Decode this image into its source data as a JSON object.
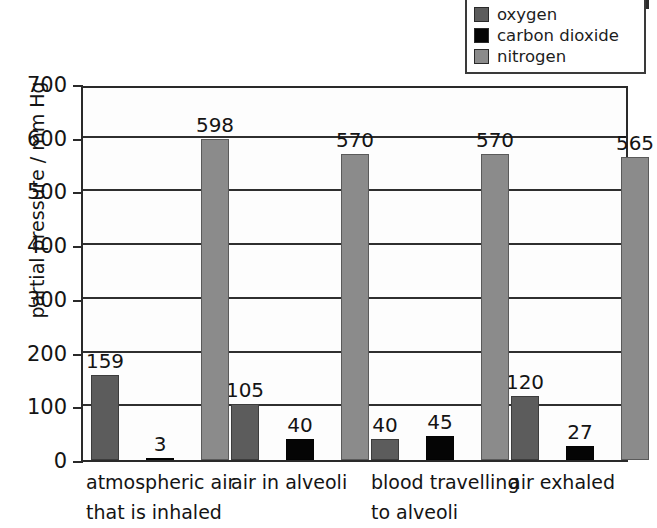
{
  "chart_data": {
    "type": "bar",
    "title": "",
    "subtitle": "",
    "xlabel": "",
    "ylabel": "partial pressure / mm Hg",
    "ylim": [
      0,
      700
    ],
    "ytick_step": 100,
    "yticks": [
      "0",
      "100",
      "200",
      "300",
      "400",
      "500",
      "600",
      "700"
    ],
    "grid": "horizontal",
    "legend_position": "top-right",
    "categories": [
      "atmospheric air that is inhaled",
      "air in alveoli",
      "blood travelling to alveoli",
      "air exhaled"
    ],
    "category_lines": [
      [
        "atmospheric air",
        "that is inhaled"
      ],
      [
        "air in alveoli"
      ],
      [
        "blood travelling",
        "to alveoli"
      ],
      [
        "air exhaled"
      ]
    ],
    "series": [
      {
        "name": "oxygen",
        "color": "#5c5c5c",
        "values": [
          159,
          105,
          40,
          120
        ],
        "labels": [
          "159",
          "105",
          "40",
          "120"
        ]
      },
      {
        "name": "carbon dioxide",
        "color": "#050505",
        "values": [
          3,
          40,
          45,
          27
        ],
        "labels": [
          "3",
          "40",
          "45",
          "27"
        ]
      },
      {
        "name": "nitrogen",
        "color": "#8b8b8b",
        "values": [
          598,
          570,
          570,
          565
        ],
        "labels": [
          "598",
          "570",
          "570",
          "565"
        ]
      }
    ]
  },
  "legend": {
    "items": [
      {
        "label": "oxygen",
        "color": "#5c5c5c"
      },
      {
        "label": "carbon dioxide",
        "color": "#050505"
      },
      {
        "label": "nitrogen",
        "color": "#8b8b8b"
      }
    ]
  }
}
